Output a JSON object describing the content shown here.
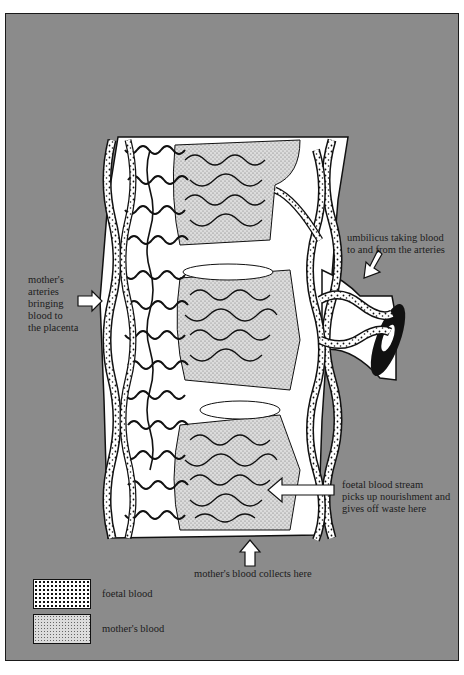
{
  "figure": {
    "background_color": "#8b8b8b",
    "ink_color": "#111111"
  },
  "labels": {
    "mothers_arteries": "mother's\narteries\nbringing\nblood to\nthe placenta",
    "umbilicus": "umbilicus taking blood\nto and from the arteries",
    "foetal_stream": "foetal blood stream\npicks up nourishment and\ngives off waste here",
    "mothers_collects": "mother's blood collects here"
  },
  "legend": {
    "items": [
      {
        "label": "foetal blood",
        "pattern": "coarse-stipple"
      },
      {
        "label": "mother's blood",
        "pattern": "fine-stipple"
      }
    ]
  },
  "arrows": [
    {
      "name": "mothers-arteries-arrow",
      "direction": "right"
    },
    {
      "name": "umbilicus-arrow",
      "direction": "down-left"
    },
    {
      "name": "foetal-stream-arrow",
      "direction": "left"
    },
    {
      "name": "mothers-collects-arrow",
      "direction": "up"
    }
  ]
}
